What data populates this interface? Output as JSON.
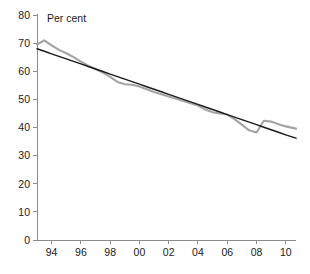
{
  "chart_data": {
    "type": "line",
    "title": "",
    "subtitle": "",
    "xlabel": "",
    "ylabel": "Per cent",
    "ylim": [
      0,
      80
    ],
    "ytick_step": 10,
    "yticks": [
      "0",
      "10",
      "20",
      "30",
      "40",
      "50",
      "60",
      "70",
      "80"
    ],
    "xlim": [
      1993,
      2010.7
    ],
    "xticks": [
      "94",
      "96",
      "98",
      "00",
      "02",
      "04",
      "06",
      "08",
      "10"
    ],
    "xtick_years": [
      1994,
      1996,
      1998,
      2000,
      2002,
      2004,
      2006,
      2008,
      2010
    ],
    "grid": false,
    "legend": "none",
    "x": [
      1993,
      1993.5,
      1994,
      1994.5,
      1995,
      1995.5,
      1996,
      1996.5,
      1997,
      1997.5,
      1998,
      1998.5,
      1999,
      1999.5,
      2000,
      2000.5,
      2001,
      2001.5,
      2002,
      2002.5,
      2003,
      2003.5,
      2004,
      2004.5,
      2005,
      2005.5,
      2006,
      2006.5,
      2007,
      2007.5,
      2008,
      2008.5,
      2009,
      2009.5,
      2010,
      2010.7
    ],
    "series": [
      {
        "name": "observed",
        "color": "#a3a3a3",
        "width": 2.1,
        "values": [
          69.5,
          71.0,
          69.2,
          67.6,
          66.4,
          65.0,
          63.4,
          62.0,
          60.8,
          59.5,
          58.0,
          56.2,
          55.4,
          55.2,
          54.6,
          53.6,
          52.6,
          51.8,
          51.0,
          50.2,
          49.4,
          48.6,
          47.8,
          46.4,
          45.4,
          45.0,
          44.6,
          43.0,
          41.0,
          39.0,
          38.2,
          42.4,
          42.1,
          41.2,
          40.4,
          39.6
        ]
      },
      {
        "name": "linear-trend",
        "color": "#1a1a1a",
        "width": 1.4,
        "values": [
          68.0,
          67.1,
          66.2,
          65.3,
          64.4,
          63.5,
          62.6,
          61.7,
          60.8,
          59.9,
          59.0,
          58.1,
          57.2,
          56.3,
          55.4,
          54.5,
          53.6,
          52.7,
          51.8,
          50.9,
          50.0,
          49.1,
          48.2,
          47.3,
          46.4,
          45.5,
          44.6,
          43.7,
          42.8,
          41.9,
          41.0,
          40.1,
          39.2,
          38.3,
          37.4,
          36.2
        ]
      }
    ]
  },
  "caption": {
    "line": ""
  }
}
